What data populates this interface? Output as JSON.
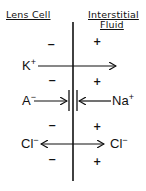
{
  "headers": {
    "left": "Lens Cell",
    "right_line1": "Interstitial",
    "right_line2": "Fluid"
  },
  "ions": {
    "k": {
      "symbol": "K",
      "charge": "+"
    },
    "a": {
      "symbol": "A",
      "charge": "−"
    },
    "na": {
      "symbol": "Na",
      "charge": "+"
    },
    "cl_left": {
      "symbol": "Cl",
      "charge": "−"
    },
    "cl_right": {
      "symbol": "Cl",
      "charge": "−"
    }
  },
  "charges": {
    "left": [
      "−",
      "−",
      "−",
      "−"
    ],
    "right": [
      "+",
      "+",
      "+",
      "+"
    ]
  },
  "flows": [
    {
      "ion": "K+",
      "direction": "lens-cell-to-interstitial-fluid"
    },
    {
      "ion": "A-",
      "direction": "toward-membrane-blocked"
    },
    {
      "ion": "Na+",
      "direction": "toward-membrane-blocked"
    },
    {
      "ion": "Cl-",
      "direction": "bidirectional"
    }
  ],
  "colors": {
    "ink": "#111111",
    "background": "#ffffff"
  }
}
